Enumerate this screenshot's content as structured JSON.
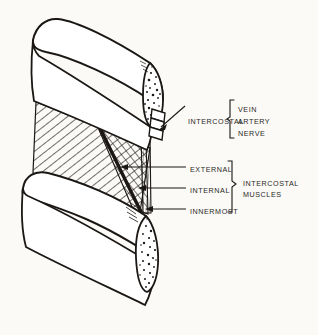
{
  "figure": {
    "ink_color": "#1a1714",
    "paper_color": "#fbfaf7",
    "structures": [
      "upper-rib",
      "lower-rib",
      "upper-rib-cut-cross-section",
      "lower-rib-cut-cross-section",
      "external-intercostal-muscle",
      "internal-intercostal-muscle",
      "innermost-intercostal-muscle",
      "neurovascular-bundle"
    ]
  },
  "labels": {
    "intercostal": "INTERCOSTAL",
    "vein": "VEIN",
    "artery": "ARTERY",
    "nerve": "NERVE",
    "external": "EXTERNAL",
    "internal": "INTERNAL",
    "innermost": "INNERMOST",
    "intercostal_muscles_line1": "INTERCOSTAL",
    "intercostal_muscles_line2": "MUSCLES"
  }
}
